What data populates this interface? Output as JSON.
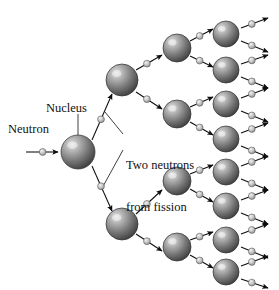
{
  "figure": {
    "background_color": "#ffffff",
    "width": 279,
    "height": 290
  },
  "labels": {
    "neutron": "Neutron",
    "nucleus": "Nucleus",
    "fission_line1": "Two neutrons",
    "fission_line2": "from fission"
  },
  "colors": {
    "nucleus_dark": "#4a4a4a",
    "nucleus_mid": "#8d8d8d",
    "nucleus_light": "#d8d8d8",
    "nucleus_edge": "#2f2f2f",
    "neutron_light": "#e8e8e8",
    "neutron_mid": "#b4b4b4",
    "neutron_edge": "#555555",
    "arrow_black": "#0d0d0d",
    "leader_line": "#2a2a2a",
    "text": "#111111"
  },
  "diagram": {
    "type": "chain-reaction-tree",
    "generations": 4,
    "nuclei_per_generation": [
      1,
      2,
      4,
      8
    ],
    "neutrons_emitted_per_fission": 2,
    "nuclei": [
      {
        "id": "g1-n1",
        "generation": 1,
        "cx": 78,
        "cy": 152,
        "r": 17
      },
      {
        "id": "g2-n1",
        "generation": 2,
        "cx": 122,
        "cy": 80,
        "r": 16
      },
      {
        "id": "g2-n2",
        "generation": 2,
        "cx": 122,
        "cy": 224,
        "r": 16
      },
      {
        "id": "g3-n1",
        "generation": 3,
        "cx": 177,
        "cy": 48,
        "r": 14
      },
      {
        "id": "g3-n2",
        "generation": 3,
        "cx": 177,
        "cy": 114,
        "r": 14
      },
      {
        "id": "g3-n3",
        "generation": 3,
        "cx": 177,
        "cy": 181,
        "r": 14
      },
      {
        "id": "g3-n4",
        "generation": 3,
        "cx": 177,
        "cy": 247,
        "r": 14
      },
      {
        "id": "g4-n1",
        "generation": 4,
        "cx": 226,
        "cy": 34,
        "r": 13
      },
      {
        "id": "g4-n2",
        "generation": 4,
        "cx": 226,
        "cy": 70,
        "r": 13
      },
      {
        "id": "g4-n3",
        "generation": 4,
        "cx": 226,
        "cy": 104,
        "r": 13
      },
      {
        "id": "g4-n4",
        "generation": 4,
        "cx": 226,
        "cy": 139,
        "r": 13
      },
      {
        "id": "g4-n5",
        "generation": 4,
        "cx": 226,
        "cy": 172,
        "r": 13
      },
      {
        "id": "g4-n6",
        "generation": 4,
        "cx": 226,
        "cy": 206,
        "r": 13
      },
      {
        "id": "g4-n7",
        "generation": 4,
        "cx": 226,
        "cy": 240,
        "r": 13
      },
      {
        "id": "g4-n8",
        "generation": 4,
        "cx": 226,
        "cy": 272,
        "r": 13
      }
    ],
    "neutrons": [
      {
        "id": "incident",
        "x1": 26,
        "y1": 152,
        "x2": 58,
        "y2": 152,
        "bead": 0.52
      },
      {
        "id": "g1-out-up",
        "x1": 92,
        "y1": 140,
        "x2": 112,
        "y2": 94,
        "bead": 0.45
      },
      {
        "id": "g1-out-down",
        "x1": 92,
        "y1": 166,
        "x2": 112,
        "y2": 211,
        "bead": 0.45
      },
      {
        "id": "g2a-out-up",
        "x1": 136,
        "y1": 70,
        "x2": 162,
        "y2": 55,
        "bead": 0.42
      },
      {
        "id": "g2a-out-down",
        "x1": 136,
        "y1": 92,
        "x2": 162,
        "y2": 109,
        "bead": 0.42
      },
      {
        "id": "g2b-out-up",
        "x1": 136,
        "y1": 214,
        "x2": 162,
        "y2": 190,
        "bead": 0.42
      },
      {
        "id": "g2b-out-down",
        "x1": 136,
        "y1": 234,
        "x2": 162,
        "y2": 251,
        "bead": 0.42
      },
      {
        "id": "g3a-out-up",
        "x1": 190,
        "y1": 41,
        "x2": 213,
        "y2": 29,
        "bead": 0.42
      },
      {
        "id": "g3a-out-down",
        "x1": 190,
        "y1": 56,
        "x2": 213,
        "y2": 67,
        "bead": 0.42
      },
      {
        "id": "g3b-out-up",
        "x1": 190,
        "y1": 107,
        "x2": 213,
        "y2": 97,
        "bead": 0.42
      },
      {
        "id": "g3b-out-down",
        "x1": 190,
        "y1": 122,
        "x2": 213,
        "y2": 135,
        "bead": 0.42
      },
      {
        "id": "g3c-out-up",
        "x1": 190,
        "y1": 174,
        "x2": 213,
        "y2": 165,
        "bead": 0.42
      },
      {
        "id": "g3c-out-down",
        "x1": 190,
        "y1": 189,
        "x2": 213,
        "y2": 202,
        "bead": 0.42
      },
      {
        "id": "g3d-out-up",
        "x1": 190,
        "y1": 240,
        "x2": 213,
        "y2": 232,
        "bead": 0.42
      },
      {
        "id": "g3d-out-down",
        "x1": 190,
        "y1": 255,
        "x2": 213,
        "y2": 268,
        "bead": 0.42
      },
      {
        "id": "g4a-out-up",
        "x1": 241,
        "y1": 28,
        "x2": 268,
        "y2": 18,
        "bead": 0.4
      },
      {
        "id": "g4a-out-down",
        "x1": 241,
        "y1": 41,
        "x2": 268,
        "y2": 52,
        "bead": 0.4
      },
      {
        "id": "g4b-out-up",
        "x1": 241,
        "y1": 64,
        "x2": 268,
        "y2": 55,
        "bead": 0.4
      },
      {
        "id": "g4b-out-down",
        "x1": 241,
        "y1": 77,
        "x2": 268,
        "y2": 88,
        "bead": 0.4
      },
      {
        "id": "g4c-out-up",
        "x1": 241,
        "y1": 98,
        "x2": 268,
        "y2": 88,
        "bead": 0.4
      },
      {
        "id": "g4c-out-down",
        "x1": 241,
        "y1": 111,
        "x2": 268,
        "y2": 122,
        "bead": 0.4
      },
      {
        "id": "g4d-out-up",
        "x1": 241,
        "y1": 133,
        "x2": 268,
        "y2": 123,
        "bead": 0.4
      },
      {
        "id": "g4d-out-down",
        "x1": 241,
        "y1": 146,
        "x2": 268,
        "y2": 157,
        "bead": 0.4
      },
      {
        "id": "g4e-out-up",
        "x1": 241,
        "y1": 166,
        "x2": 268,
        "y2": 156,
        "bead": 0.4
      },
      {
        "id": "g4e-out-down",
        "x1": 241,
        "y1": 179,
        "x2": 268,
        "y2": 190,
        "bead": 0.4
      },
      {
        "id": "g4f-out-up",
        "x1": 241,
        "y1": 200,
        "x2": 268,
        "y2": 190,
        "bead": 0.4
      },
      {
        "id": "g4f-out-down",
        "x1": 241,
        "y1": 213,
        "x2": 268,
        "y2": 224,
        "bead": 0.4
      },
      {
        "id": "g4g-out-up",
        "x1": 241,
        "y1": 234,
        "x2": 268,
        "y2": 224,
        "bead": 0.4
      },
      {
        "id": "g4g-out-down",
        "x1": 241,
        "y1": 247,
        "x2": 268,
        "y2": 258,
        "bead": 0.4
      },
      {
        "id": "g4h-out-up",
        "x1": 241,
        "y1": 266,
        "x2": 268,
        "y2": 256,
        "bead": 0.4
      },
      {
        "id": "g4h-out-down",
        "x1": 241,
        "y1": 279,
        "x2": 268,
        "y2": 288,
        "bead": 0.4
      }
    ],
    "leaders": [
      {
        "id": "nucleus-leader",
        "x1": 78,
        "y1": 114,
        "x2": 78,
        "y2": 137
      },
      {
        "id": "fission-leader-up",
        "x1": 123,
        "y1": 134,
        "x2": 105,
        "y2": 112
      },
      {
        "id": "fission-leader-down",
        "x1": 123,
        "y1": 150,
        "x2": 101,
        "y2": 190
      }
    ]
  }
}
